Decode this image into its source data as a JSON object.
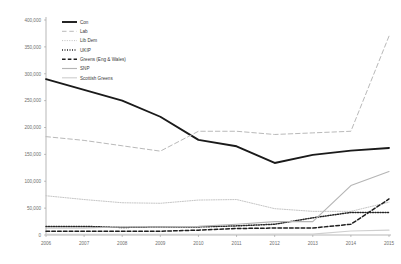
{
  "chart_data": {
    "type": "line",
    "title": "",
    "subtitle": "",
    "xlabel": "",
    "ylabel": "",
    "x": [
      2006,
      2007,
      2008,
      2009,
      2010,
      2011,
      2012,
      2013,
      2014,
      2015
    ],
    "x_tick_labels": [
      "2006",
      "2007",
      "2008",
      "2009",
      "2010",
      "2011",
      "2012",
      "2013",
      "2014",
      "2015"
    ],
    "y_tick_labels": [
      "0",
      "50,000",
      "100,000",
      "150,000",
      "200,000",
      "250,000",
      "300,000",
      "350,000",
      "400,000"
    ],
    "y_tick_values": [
      0,
      50000,
      100000,
      150000,
      200000,
      250000,
      300000,
      350000,
      400000
    ],
    "ylim": [
      0,
      400000
    ],
    "xlim": [
      2006,
      2015
    ],
    "grid": false,
    "legend_position": "top-left",
    "series": [
      {
        "name": "Con",
        "style": "solid-thick",
        "color": "#1a1a1a",
        "values": [
          290000,
          270000,
          250000,
          220000,
          177000,
          165000,
          134000,
          149000,
          157000,
          162000
        ]
      },
      {
        "name": "Lab",
        "style": "dashed",
        "color": "#b9b9b9",
        "values": [
          183000,
          176000,
          166000,
          156000,
          193000,
          193000,
          187000,
          190000,
          193000,
          370000
        ]
      },
      {
        "name": "Lib Dem",
        "style": "dotted-fine",
        "color": "#c2c2c2",
        "values": [
          73000,
          66000,
          60000,
          59000,
          65000,
          66000,
          49000,
          44000,
          44000,
          61000
        ]
      },
      {
        "name": "UKIP",
        "style": "dotted-bold",
        "color": "#262626",
        "values": [
          16000,
          16000,
          14000,
          15000,
          15000,
          17000,
          20000,
          32000,
          42000,
          42000
        ]
      },
      {
        "name": "Greens (Eng & Wales)",
        "style": "dashed-bold",
        "color": "#1f1f1f",
        "values": [
          7000,
          7000,
          7000,
          7000,
          9000,
          12000,
          13000,
          13000,
          20000,
          67000
        ]
      },
      {
        "name": "SNP",
        "style": "solid-thin",
        "color": "#b5b5b5",
        "values": [
          13000,
          13000,
          15000,
          15000,
          16000,
          20000,
          25000,
          25000,
          92000,
          118000
        ]
      },
      {
        "name": "Scottish Greens",
        "style": "solid-pale",
        "color": "#cfcfcf",
        "values": [
          1200,
          1200,
          1200,
          1200,
          1300,
          1400,
          1500,
          1700,
          7500,
          9000
        ]
      }
    ]
  }
}
